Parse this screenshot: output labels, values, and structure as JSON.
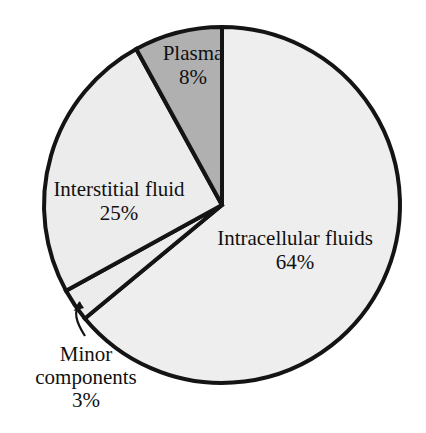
{
  "chart_data": {
    "type": "pie",
    "title": "",
    "subtitle": "",
    "xlabel": "",
    "ylabel": "",
    "legend_position": "none",
    "grid": false,
    "start_angle_deg": 90,
    "direction": "counterclockwise",
    "categories": [
      "Plasma",
      "Interstitial fluid",
      "Minor components",
      "Intracellular fluids"
    ],
    "values": [
      8,
      25,
      3,
      64
    ],
    "units": "%",
    "slices": [
      {
        "name": "Plasma",
        "value": 8,
        "value_label": "8%",
        "color": "#b0b0b0",
        "stroke": "#141414",
        "label_placement": "inside",
        "callout": false
      },
      {
        "name": "Interstitial fluid",
        "value": 25,
        "value_label": "25%",
        "color": "#ececec",
        "stroke": "#141414",
        "label_placement": "inside",
        "callout": false
      },
      {
        "name": "Minor components",
        "value": 3,
        "value_label": "3%",
        "color": "#ececec",
        "stroke": "#141414",
        "label_placement": "outside",
        "callout": true
      },
      {
        "name": "Intracellular fluids",
        "value": 64,
        "value_label": "64%",
        "color": "#eeeeee",
        "stroke": "#141414",
        "label_placement": "inside",
        "callout": false
      }
    ]
  },
  "labels": {
    "plasma": {
      "name": "Plasma",
      "value": "8%"
    },
    "interstitial": {
      "name": "Interstitial fluid",
      "value": "25%"
    },
    "intracellular": {
      "name": "Intracellular fluids",
      "value": "64%"
    },
    "minor": {
      "name_line1": "Minor",
      "name_line2": "components",
      "value": "3%"
    }
  },
  "colors": {
    "background": "#ffffff",
    "outline": "#141414",
    "slice_light": "#ececec",
    "slice_lighter": "#eeeeee",
    "slice_dark": "#b0b0b0",
    "text": "#111111"
  },
  "geometry": {
    "center_x": 222,
    "center_y": 205,
    "radius": 178
  }
}
